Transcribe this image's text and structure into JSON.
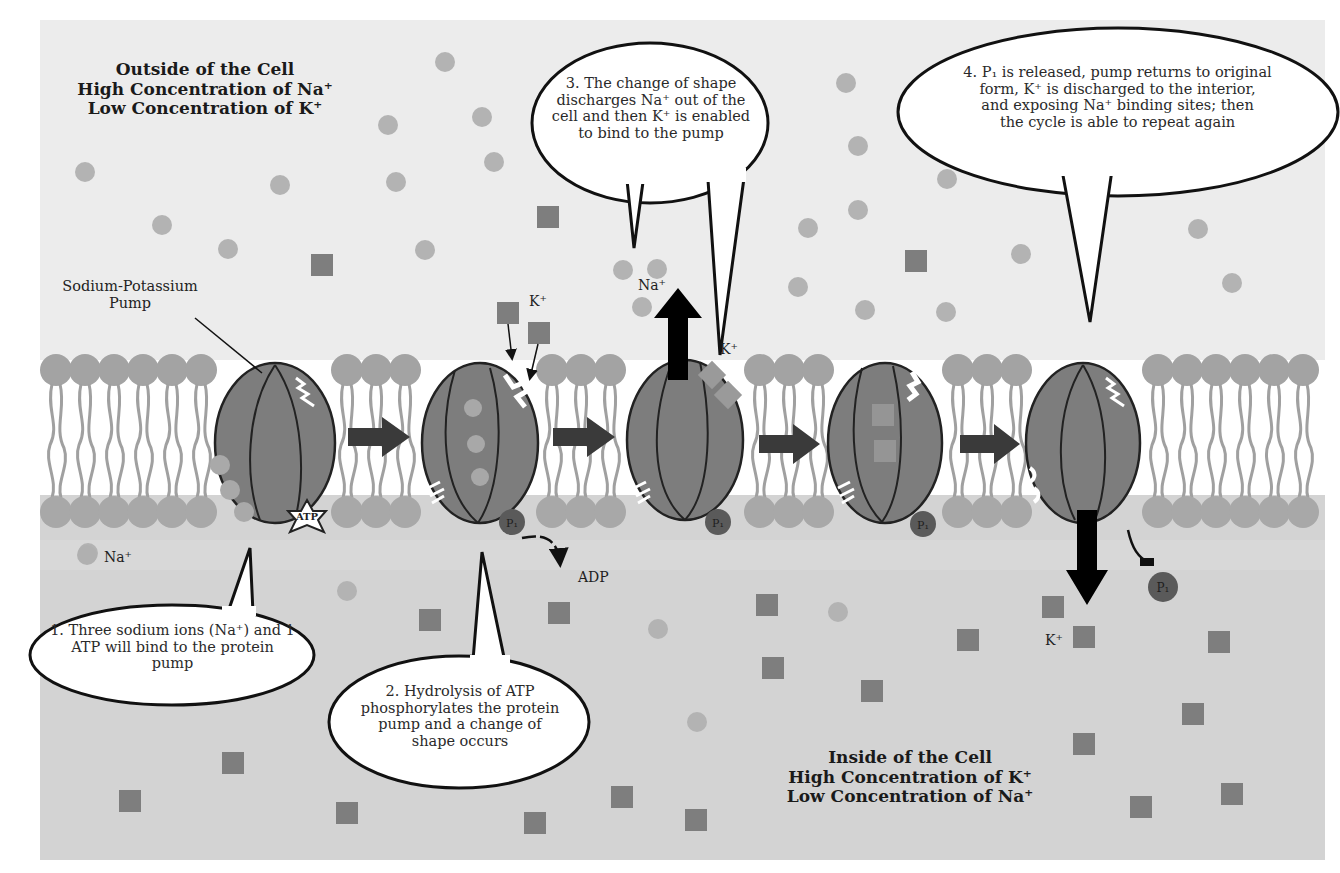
{
  "outside": {
    "title": "Outside of the Cell",
    "line2": "High Concentration of Na⁺",
    "line3": "Low Concentration of K⁺"
  },
  "inside": {
    "title": "Inside of the Cell",
    "line2": "High Concentration of K⁺",
    "line3": "Low Concentration of Na⁺"
  },
  "pump_label": {
    "line1": "Sodium-Potassium",
    "line2": "Pump"
  },
  "ion_labels": {
    "na_legend": "Na⁺",
    "k_step2": "K⁺",
    "na_step3": "Na⁺",
    "k_step3": "K⁺",
    "k_step4": "K⁺",
    "adp": "ADP",
    "atp": "ATP",
    "pi": "P₁"
  },
  "steps": [
    {
      "number": 1,
      "lines": [
        "1. Three sodium ions (Na⁺) and 1",
        "ATP will bind to the protein",
        "pump"
      ]
    },
    {
      "number": 2,
      "lines": [
        "2. Hydrolysis of ATP",
        "phosphorylates the protein",
        "pump and a change of",
        "shape occurs"
      ]
    },
    {
      "number": 3,
      "lines": [
        "3. The change of shape",
        "discharges Na⁺ out of the",
        "cell and then K⁺ is enabled",
        "to bind to the pump"
      ]
    },
    {
      "number": 4,
      "lines": [
        "4. P₁ is released, pump returns to original",
        "form, K⁺ is discharged to the interior,",
        "and exposing Na⁺ binding sites; then",
        "the cycle is able to repeat again"
      ]
    }
  ],
  "colors": {
    "outside_bg": "#ececec",
    "membrane_core": "#ffffff",
    "inside_bg": "#d2d2d2",
    "lipid_head": "#a3a3a3",
    "pump_fill": "#7d7d7d",
    "pump_stroke": "#222222",
    "na_ion": "#b0b0b0",
    "k_ion": "#808080",
    "arrow": "#3a3a3a",
    "phosphate": "#5a5a5a"
  }
}
